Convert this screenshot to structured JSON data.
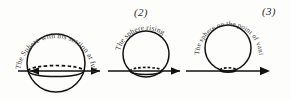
{
  "figure": {
    "background_color": "#fdfdfc",
    "ink_color": "#111111",
    "horizon": {
      "y": 71,
      "segments": [
        {
          "x1": 18,
          "x2": 100
        },
        {
          "x1": 108,
          "x2": 180
        },
        {
          "x1": 186,
          "x2": 268
        }
      ],
      "arrowheads": [
        {
          "x": 30,
          "y": 71,
          "direction": "left"
        },
        {
          "x": 97,
          "y": 71,
          "direction": "right"
        },
        {
          "x": 178,
          "y": 71,
          "direction": "right"
        },
        {
          "x": 268,
          "y": 71,
          "direction": "right"
        }
      ]
    },
    "spheres": [
      {
        "id": 1,
        "number_label": "",
        "caption": "The Sphere with his section at full size",
        "cx": 56,
        "cy": 63,
        "r": 29,
        "equator_cy": 71,
        "equator_rx": 28,
        "equator_ry": 5.5,
        "state": "half-above-horizon"
      },
      {
        "id": 2,
        "number_label": "(2)",
        "caption": "The sphere rising",
        "cx": 146,
        "cy": 54,
        "r": 23,
        "equator_cy": 71,
        "equator_rx": 16,
        "equator_ry": 3.6,
        "state": "rising"
      },
      {
        "id": 3,
        "number_label": "(3)",
        "caption": "The sphere on the point of vanishing from my eye",
        "cx": 228,
        "cy": 48,
        "r": 23,
        "equator_cy": 70,
        "equator_rx": 8,
        "equator_ry": 2.2,
        "state": "vanishing"
      }
    ]
  }
}
